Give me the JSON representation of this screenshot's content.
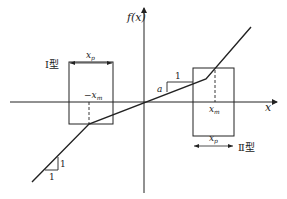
{
  "diagram": {
    "type": "piecewise-linear function with dead-zone/saturation windows",
    "axes": {
      "y_label": "f(x)",
      "x_label": "x"
    },
    "curve": {
      "points": [
        [
          32,
          182
        ],
        [
          89,
          124
        ],
        [
          206,
          79
        ],
        [
          251,
          27
        ]
      ],
      "segments": [
        "slope 1",
        "slope a",
        "slope 1"
      ]
    },
    "box_type_1": {
      "label": "Ⅰ型",
      "width_label": "x",
      "width_sub": "p",
      "center_label_prefix": "−x",
      "center_label_sub": "m"
    },
    "box_type_2": {
      "label": "Ⅱ型",
      "width_label": "x",
      "width_sub": "p",
      "center_label": "x",
      "center_label_sub": "m"
    },
    "slope_middle": {
      "run": "1",
      "rise": "a"
    },
    "slope_lower": {
      "run": "1",
      "rise": "1"
    }
  }
}
